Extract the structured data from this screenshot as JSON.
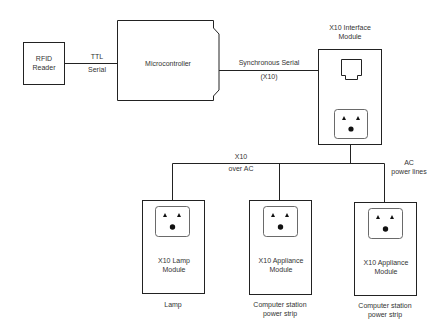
{
  "diagram": {
    "colors": {
      "stroke": "#222222",
      "text": "#333333",
      "background": "#ffffff"
    },
    "nodes": {
      "rfid_reader": {
        "line1": "RFID",
        "line2": "Reader"
      },
      "microcontroller": {
        "label": "Microcontroller"
      },
      "x10_interface": {
        "line1": "X10 Interface",
        "line2": "Module",
        "icons": [
          "rj-jack-icon",
          "outlet-icon"
        ]
      },
      "lamp_module": {
        "line1": "X10 Lamp",
        "line2": "Module",
        "caption": "Lamp"
      },
      "appliance_module_1": {
        "line1": "X10 Appliance",
        "line2": "Module",
        "caption1": "Computer station",
        "caption2": "power strip"
      },
      "appliance_module_2": {
        "line1": "X10 Appliance",
        "line2": "Module",
        "caption1": "Computer station",
        "caption2": "power strip"
      }
    },
    "edges": {
      "rfid_to_mcu": {
        "line1": "TTL",
        "line2": "Serial"
      },
      "mcu_to_x10": {
        "line1": "Synchronous Serial",
        "line2": "(X10)"
      },
      "ac_bus": {
        "line1": "X10",
        "line2": "over AC"
      },
      "ac_power": {
        "line1": "AC",
        "line2": "power lines"
      }
    }
  }
}
